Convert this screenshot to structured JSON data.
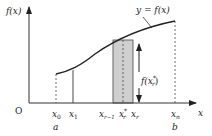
{
  "diagram": {
    "curve_label": "y = f(x)",
    "y_axis_label": "f(x)",
    "x_axis_label": "x",
    "origin_label": "O",
    "ticks": {
      "x0": {
        "main": "x",
        "sub": "0"
      },
      "x1": {
        "main": "x",
        "sub": "1"
      },
      "xr_minus_1": {
        "main": "x",
        "sub": "r−1"
      },
      "xr_star": {
        "main": "x",
        "sup": "*",
        "sub": "r"
      },
      "xr": {
        "main": "x",
        "sub": "r"
      },
      "xn": {
        "main": "x",
        "sub": "n"
      }
    },
    "a_label": "a",
    "b_label": "b",
    "height_label": {
      "main": "f(x",
      "sup": "*",
      "sub": "r",
      "close": ")"
    },
    "colors": {
      "axis": "#333333",
      "curve": "#222222",
      "shade": "#c8c8c8",
      "dashed": "#444444"
    }
  }
}
